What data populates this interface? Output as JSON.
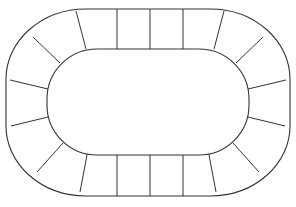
{
  "diagram": {
    "type": "oval-track-board",
    "stroke_color": "#333333",
    "background": "#ffffff",
    "space_count": 24,
    "outer": {
      "x": 6,
      "y": 9,
      "w": 284,
      "h": 187,
      "rx": 80,
      "ry": 70
    },
    "inner": {
      "x": 47,
      "y": 49,
      "w": 202,
      "h": 106,
      "rx": 50,
      "ry": 50
    },
    "dividers": [
      [
        117,
        9,
        117,
        49
      ],
      [
        150,
        9,
        150,
        49
      ],
      [
        183,
        9,
        183,
        49
      ],
      [
        76,
        11,
        86,
        49
      ],
      [
        224,
        11,
        214,
        49
      ],
      [
        33,
        37,
        60,
        63
      ],
      [
        263,
        37,
        236,
        63
      ],
      [
        10,
        80,
        48,
        89
      ],
      [
        286,
        80,
        248,
        89
      ],
      [
        11,
        126,
        48,
        117
      ],
      [
        285,
        126,
        248,
        117
      ],
      [
        37,
        172,
        63,
        143
      ],
      [
        259,
        172,
        233,
        143
      ],
      [
        80,
        192,
        87,
        155
      ],
      [
        216,
        192,
        209,
        155
      ],
      [
        117,
        196,
        117,
        155
      ],
      [
        150,
        196,
        150,
        155
      ],
      [
        183,
        196,
        183,
        155
      ]
    ]
  },
  "caption": {
    "text": ""
  }
}
